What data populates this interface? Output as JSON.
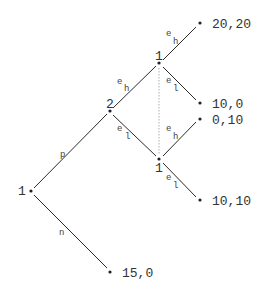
{
  "diagram": {
    "type": "extensive-form game tree",
    "nodes": {
      "root": {
        "player": "1",
        "x": 31,
        "y": 191
      },
      "p2": {
        "player": "2",
        "x": 110,
        "y": 111
      },
      "p1_high": {
        "player": "1",
        "x": 159,
        "y": 63
      },
      "p1_low": {
        "player": "1",
        "x": 159,
        "y": 159
      }
    },
    "edges": {
      "root_p": {
        "action": "p"
      },
      "root_n": {
        "action": "n"
      },
      "p2_high": {
        "action_base": "e",
        "action_sub": "h"
      },
      "p2_low": {
        "action_base": "e",
        "action_sub": "l"
      },
      "p1h_high": {
        "action_base": "e",
        "action_sub": "h"
      },
      "p1h_low": {
        "action_base": "e",
        "action_sub": "l"
      },
      "p1l_high": {
        "action_base": "e",
        "action_sub": "h"
      },
      "p1l_low": {
        "action_base": "e",
        "action_sub": "l"
      }
    },
    "payoffs": {
      "t1": "20,20",
      "t2": "10,0",
      "t3": "0,10",
      "t4": "10,10",
      "t5": "15,0"
    },
    "information_set": "dotted line connecting player 1 nodes after player 2's move"
  }
}
